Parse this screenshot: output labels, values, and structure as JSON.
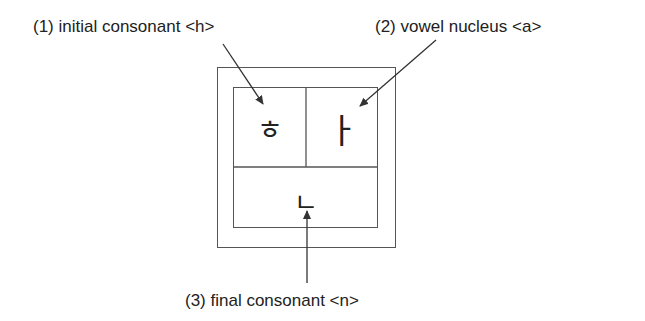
{
  "labels": {
    "initial": "(1) initial consonant <h>",
    "vowel": "(2) vowel nucleus <a>",
    "final": "(3) final consonant <n>"
  },
  "syllable_block": {
    "initial_jamo": "ㅎ",
    "vowel_jamo": "ㅏ",
    "final_jamo": "ㄴ"
  },
  "colors": {
    "line": "#555555",
    "text": "#222222"
  }
}
